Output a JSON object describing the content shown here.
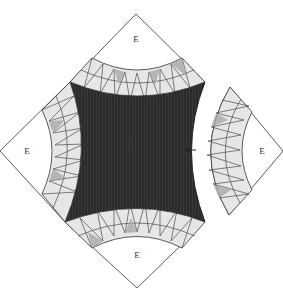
{
  "diagram": {
    "center_label": "F",
    "corner_labels": {
      "top": "E",
      "left": "E",
      "bottom": "E",
      "right": "E"
    },
    "arrow": {
      "direction": "left",
      "meaning": "detached right corner unit moves into position"
    },
    "colors": {
      "center_fill": "#2b2b2b",
      "light_triangle": "#d6d6d6",
      "mid_triangle": "#a9a9a9",
      "white_triangle": "#ffffff",
      "outline": "#333333"
    }
  }
}
